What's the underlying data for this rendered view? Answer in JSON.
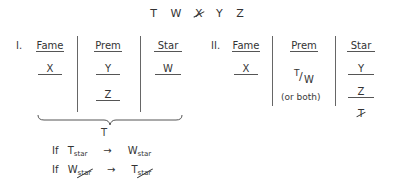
{
  "letters": [
    {
      "label": "T",
      "struck": false
    },
    {
      "label": "W",
      "struck": false
    },
    {
      "label": "X",
      "struck": true
    },
    {
      "label": "Y",
      "struck": false
    },
    {
      "label": "Z",
      "struck": false
    }
  ],
  "scenario1": {
    "label": "I.",
    "columns": {
      "fame": {
        "header": "Fame",
        "entries": [
          "X"
        ]
      },
      "prem": {
        "header": "Prem",
        "entries": [
          "Y",
          "Z"
        ]
      },
      "star": {
        "header": "Star",
        "entries": [
          "W"
        ]
      }
    },
    "brace_label": "T"
  },
  "scenario2": {
    "label": "II.",
    "columns": {
      "fame": {
        "header": "Fame",
        "entries": [
          "X"
        ]
      },
      "prem": {
        "header": "Prem",
        "entries": [
          "T/W",
          "(or both)"
        ],
        "top": "T",
        "bottom": "W",
        "note": "(or both)"
      },
      "star": {
        "header": "Star",
        "entries": [
          "Y",
          "Z",
          "T"
        ],
        "struck_entry": "T"
      }
    }
  },
  "rules": [
    {
      "prefix": "If",
      "left": "T",
      "left_sub": "star",
      "left_struck": false,
      "arrow": "→",
      "right": "W",
      "right_sub": "star",
      "right_struck": false
    },
    {
      "prefix": "If",
      "left": "W",
      "left_sub": "star",
      "left_struck": true,
      "arrow": "→",
      "right": "T",
      "right_sub": "star",
      "right_struck": true
    }
  ]
}
